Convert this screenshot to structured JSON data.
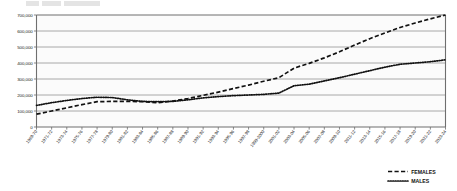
{
  "chart_data": {
    "type": "line",
    "title": "",
    "xlabel": "",
    "ylabel": "",
    "ylim": [
      0,
      700000
    ],
    "ytick_step": 100000,
    "ytick_labels": [
      "0",
      "100,000",
      "200,000",
      "300,000",
      "400,000",
      "500,000",
      "600,000",
      "700,000"
    ],
    "ytick_values": [
      0,
      100000,
      200000,
      300000,
      400000,
      500000,
      600000,
      700000
    ],
    "grid": true,
    "legend_position": "bottom-right",
    "categories": [
      "1969-70",
      "1971-72",
      "1973-74",
      "1975-76",
      "1977-78",
      "1979-80",
      "1981-82",
      "1983-84",
      "1985-86",
      "1987-88",
      "1989-90",
      "1991-92",
      "1993-94",
      "1995-96",
      "1997-98",
      "1999-2000",
      "2001-02",
      "2003-04",
      "2005-06",
      "2007-08",
      "2009-10",
      "2011-12",
      "2013-14",
      "2015-16",
      "2017-18",
      "2019-20",
      "2021-22",
      "2023-24"
    ],
    "series": [
      {
        "name": "FEMALES",
        "style": "dashed",
        "color": "#111111",
        "values": [
          80000,
          100000,
          120000,
          140000,
          158000,
          160000,
          160000,
          158000,
          152000,
          162000,
          178000,
          198000,
          218000,
          240000,
          262000,
          286000,
          308000,
          368000,
          398000,
          432000,
          470000,
          512000,
          552000,
          588000,
          622000,
          650000,
          676000,
          700000
        ]
      },
      {
        "name": "MALES",
        "style": "dotted",
        "color": "#111111",
        "values": [
          135000,
          152000,
          166000,
          178000,
          186000,
          184000,
          170000,
          160000,
          158000,
          160000,
          170000,
          182000,
          190000,
          196000,
          200000,
          204000,
          212000,
          258000,
          268000,
          288000,
          308000,
          330000,
          352000,
          374000,
          392000,
          400000,
          408000,
          420000
        ]
      }
    ],
    "legend": [
      {
        "label": "FEMALES",
        "style": "dashed"
      },
      {
        "label": "MALES",
        "style": "dotted"
      }
    ]
  }
}
